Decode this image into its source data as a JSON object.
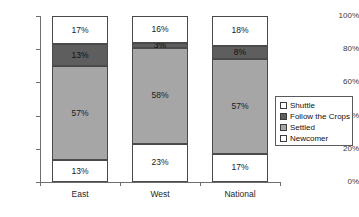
{
  "chart_data": {
    "type": "bar",
    "subtype": "stacked-percentage",
    "title": "",
    "xlabel": "",
    "ylabel": "",
    "ylim": [
      0,
      100
    ],
    "ytick_labels": [
      "0%",
      "20%",
      "40%",
      "60%",
      "80%",
      "100%"
    ],
    "ytick_values": [
      0,
      20,
      40,
      60,
      80,
      100
    ],
    "grid": false,
    "legend_position": "right",
    "categories": [
      "East",
      "West",
      "National"
    ],
    "series": [
      {
        "name": "Newcomer",
        "values": [
          13,
          23,
          17
        ],
        "color": "#ffffff",
        "labels": [
          "13%",
          "23%",
          "17%"
        ]
      },
      {
        "name": "Settled",
        "values": [
          57,
          58,
          57
        ],
        "color": "#a6a6a6",
        "labels": [
          "57%",
          "58%",
          "57%"
        ]
      },
      {
        "name": "Follow the Crops",
        "values": [
          13,
          3,
          8
        ],
        "color": "#5e5e5e",
        "labels": [
          "13%",
          "3%",
          "8%"
        ]
      },
      {
        "name": "Shuttle",
        "values": [
          17,
          16,
          18
        ],
        "color": "#ffffff",
        "labels": [
          "17%",
          "16%",
          "18%"
        ]
      }
    ],
    "legend_entries": [
      {
        "label": "Shuttle",
        "color": "#ffffff"
      },
      {
        "label": "Follow the Crops",
        "color": "#5e5e5e"
      },
      {
        "label": "Settled",
        "color": "#a6a6a6"
      },
      {
        "label": "Newcomer",
        "color": "#ffffff"
      }
    ]
  }
}
